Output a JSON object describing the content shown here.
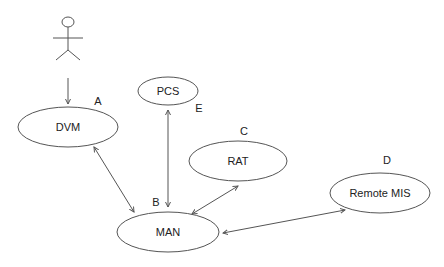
{
  "diagram": {
    "type": "use-case / component diagram",
    "actor": {
      "name": "actor",
      "label": ""
    },
    "nodes": [
      {
        "id": "DVM",
        "label": "DVM",
        "tag": "A"
      },
      {
        "id": "MAN",
        "label": "MAN",
        "tag": "B"
      },
      {
        "id": "RAT",
        "label": "RAT",
        "tag": "C"
      },
      {
        "id": "RemoteMIS",
        "label": "Remote MIS",
        "tag": "D"
      },
      {
        "id": "PCS",
        "label": "PCS",
        "tag": "E"
      }
    ],
    "edges": [
      {
        "from": "actor",
        "to": "DVM",
        "direction": "forward"
      },
      {
        "from": "DVM",
        "to": "MAN",
        "direction": "both"
      },
      {
        "from": "PCS",
        "to": "MAN",
        "direction": "both"
      },
      {
        "from": "MAN",
        "to": "RAT",
        "direction": "both"
      },
      {
        "from": "MAN",
        "to": "RemoteMIS",
        "direction": "both"
      }
    ]
  }
}
